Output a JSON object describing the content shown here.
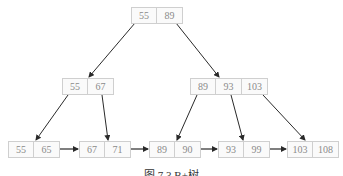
{
  "figure": {
    "caption": "图 7.3  B+树",
    "colors": {
      "edge": "#2a2a2a",
      "cell_border": "#cfcfcf",
      "key_text": "#8a8a8a"
    }
  },
  "tree": {
    "root": {
      "keys": [
        "55",
        "89"
      ]
    },
    "internal": [
      {
        "keys": [
          "55",
          "67"
        ]
      },
      {
        "keys": [
          "89",
          "93",
          "103"
        ]
      }
    ],
    "leaves": [
      {
        "keys": [
          "55",
          "65"
        ]
      },
      {
        "keys": [
          "67",
          "71"
        ]
      },
      {
        "keys": [
          "89",
          "90"
        ]
      },
      {
        "keys": [
          "93",
          "99"
        ]
      },
      {
        "keys": [
          "103",
          "108"
        ]
      }
    ]
  }
}
